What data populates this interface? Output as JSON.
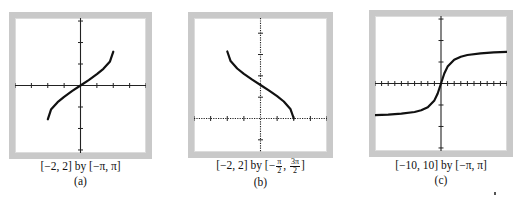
{
  "figure": {
    "panels": [
      {
        "id": "a",
        "label": "(a)",
        "caption": "[−2, 2] by [−π, π]",
        "function": "y = arcsin x",
        "x_window": [
          -2,
          2
        ],
        "y_window": [
          "-π",
          "π"
        ]
      },
      {
        "id": "b",
        "label": "(b)",
        "caption_prefix": "[−2, 2] by [−",
        "caption_frac1_num": "π",
        "caption_frac1_den": "2",
        "caption_mid": ", ",
        "caption_frac2_num": "3π",
        "caption_frac2_den": "2",
        "caption_suffix": "]",
        "function": "y = arccos x",
        "x_window": [
          -2,
          2
        ],
        "y_window": [
          "-π/2",
          "3π/2"
        ]
      },
      {
        "id": "c",
        "label": "(c)",
        "caption": "[−10, 10] by [−π, π]",
        "function": "y = arctan x",
        "x_window": [
          -10,
          10
        ],
        "y_window": [
          "-π",
          "π"
        ]
      }
    ]
  },
  "chart_data": [
    {
      "type": "line",
      "title": "(a)",
      "caption": "[-2, 2] by [-π, π]",
      "xlim": [
        -2,
        2
      ],
      "ylim": [
        -3.1416,
        3.1416
      ],
      "x_ticks_step": 0.5,
      "y_ticks_step": 1,
      "grid": false,
      "series": [
        {
          "name": "arcsin x",
          "x": [
            -1,
            -0.9,
            -0.7,
            -0.5,
            -0.25,
            0,
            0.25,
            0.5,
            0.7,
            0.9,
            1
          ],
          "y": [
            -1.571,
            -1.12,
            -0.775,
            -0.524,
            -0.253,
            0,
            0.253,
            0.524,
            0.775,
            1.12,
            1.571
          ]
        }
      ]
    },
    {
      "type": "line",
      "title": "(b)",
      "caption": "[-2, 2] by [-π/2, 3π/2]",
      "xlim": [
        -2,
        2
      ],
      "ylim": [
        -1.5708,
        4.7124
      ],
      "x_ticks_step": 0.5,
      "y_ticks_step": 1,
      "grid": false,
      "series": [
        {
          "name": "arccos x",
          "x": [
            -1,
            -0.9,
            -0.7,
            -0.5,
            -0.25,
            0,
            0.25,
            0.5,
            0.7,
            0.9,
            1
          ],
          "y": [
            3.142,
            2.691,
            2.346,
            2.094,
            1.823,
            1.571,
            1.318,
            1.047,
            0.795,
            0.451,
            0
          ]
        }
      ]
    },
    {
      "type": "line",
      "title": "(c)",
      "caption": "[-10, 10] by [-π, π]",
      "xlim": [
        -10,
        10
      ],
      "ylim": [
        -3.1416,
        3.1416
      ],
      "x_ticks_step": 1,
      "y_ticks_step": 1,
      "grid": false,
      "series": [
        {
          "name": "arctan x",
          "x": [
            -10,
            -8,
            -6,
            -4,
            -3,
            -2,
            -1,
            -0.5,
            0,
            0.5,
            1,
            2,
            3,
            4,
            6,
            8,
            10
          ],
          "y": [
            -1.471,
            -1.446,
            -1.406,
            -1.326,
            -1.249,
            -1.107,
            -0.785,
            -0.464,
            0,
            0.464,
            0.785,
            1.107,
            1.249,
            1.326,
            1.406,
            1.446,
            1.471
          ]
        }
      ]
    }
  ]
}
